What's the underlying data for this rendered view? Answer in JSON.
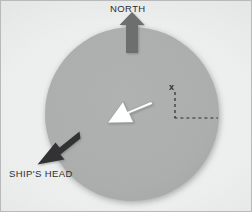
{
  "figure": {
    "background_color": "#e9eaea",
    "border_color": "#b9b9b9",
    "width": 252,
    "height": 212
  },
  "compass_disc": {
    "name": "compass-disc",
    "center_x": 131,
    "center_y": 113,
    "radius": 87,
    "fill_color": "#abacac",
    "shadow_color": "#9a9b9b"
  },
  "labels": {
    "north": "NORTH",
    "ships_head": "SHIP'S HEAD",
    "point_marker": "x"
  },
  "arrows": [
    {
      "name": "north-arrow",
      "label": "NORTH",
      "direction_deg": 0,
      "color": "#6d6e6e",
      "style": "solid-block",
      "tail_x": 131,
      "tail_y": 48,
      "head_x": 131,
      "head_y": 15
    },
    {
      "name": "ships-head-arrow",
      "label": "SHIP'S HEAD",
      "direction_deg": 225,
      "color": "#333333",
      "style": "solid-block",
      "tail_x": 74,
      "tail_y": 138,
      "head_x": 42,
      "head_y": 162
    },
    {
      "name": "relative-bearing-arrow",
      "label": "",
      "direction_deg": 235,
      "color": "#ffffff",
      "outline_color": "#8d8e8e",
      "style": "outlined-block",
      "tail_x": 148,
      "tail_y": 99,
      "head_x": 109,
      "head_y": 121
    }
  ],
  "dashed_guides": {
    "name": "dashed-guides",
    "color": "#2b2b2b",
    "dash": "3 3",
    "vertical": {
      "x": 174,
      "y_top": 90,
      "y_bottom": 117
    },
    "horizontal": {
      "y": 117,
      "x_left": 174,
      "x_right": 217
    },
    "marker_x": 174,
    "marker_y": 88
  }
}
